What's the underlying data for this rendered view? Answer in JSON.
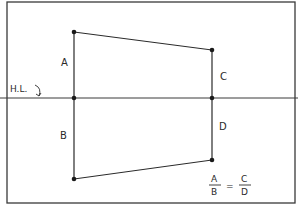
{
  "diagram": {
    "kind": "perspective-sketch",
    "horizon_label": "H.L.",
    "labels": {
      "a": "A",
      "b": "B",
      "c": "C",
      "d": "D"
    },
    "formula": {
      "left_numerator": "A",
      "left_denominator": "B",
      "equals": "=",
      "right_numerator": "C",
      "right_denominator": "D"
    },
    "colors": {
      "background": "#ffffff",
      "ink": "#2a2a2a",
      "frame": "#3a3a3a"
    }
  }
}
